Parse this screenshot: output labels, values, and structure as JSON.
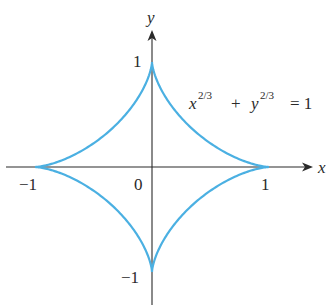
{
  "figure": {
    "curve_name": "astroid",
    "equation": {
      "x_base": "x",
      "x_exp": "2/3",
      "plus": "+",
      "y_base": "y",
      "y_exp": "2/3",
      "equals": "= 1"
    },
    "axes": {
      "x_label": "x",
      "y_label": "y",
      "origin_label": "0",
      "x_ticks": [
        "−1",
        "1"
      ],
      "y_ticks": [
        "1",
        "−1"
      ]
    },
    "colors": {
      "curve": "#4bb0e2",
      "axis": "#2a2a2a"
    }
  }
}
